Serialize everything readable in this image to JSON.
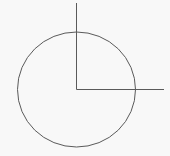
{
  "diagram": {
    "type": "geometric-figure",
    "background": "#f8f8f8",
    "stroke_color": "#5a5a5a",
    "circle": {
      "cx": 76.5,
      "cy": 89.5,
      "rx": 59,
      "ry": 57.5
    },
    "vertical_line": {
      "x1": 76.5,
      "y1": 3,
      "x2": 76.5,
      "y2": 89.5
    },
    "horizontal_line": {
      "x1": 76.5,
      "y1": 89.5,
      "x2": 164,
      "y2": 89.5
    }
  }
}
